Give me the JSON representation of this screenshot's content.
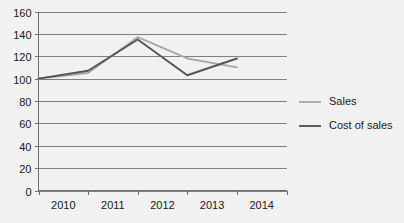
{
  "chart_data": {
    "type": "line",
    "title": "",
    "xlabel": "",
    "ylabel": "",
    "categories": [
      "2010",
      "2011",
      "2012",
      "2013",
      "2014"
    ],
    "series": [
      {
        "name": "Sales",
        "color": "#a9a9a9",
        "values": [
          100,
          105,
          137,
          118,
          110
        ]
      },
      {
        "name": "Cost of sales",
        "color": "#555555",
        "values": [
          100,
          107,
          135,
          103,
          118
        ]
      }
    ],
    "ylim": [
      0,
      160
    ],
    "ytick_step": 20,
    "yticks": [
      0,
      20,
      40,
      60,
      80,
      100,
      120,
      140,
      160
    ],
    "ytick_labels": [
      "0",
      "20",
      "40",
      "60",
      "80",
      "100",
      "120",
      "140",
      "160"
    ],
    "grid": true,
    "grid_axis": "y",
    "legend_position": "right",
    "background_color": "#f1f1f1",
    "grid_color": "#808080",
    "axis_color": "#6e6e6e",
    "text_color": "#1a1a1a"
  },
  "legend": {
    "entries": [
      {
        "label": "Sales"
      },
      {
        "label": "Cost of sales"
      }
    ]
  }
}
